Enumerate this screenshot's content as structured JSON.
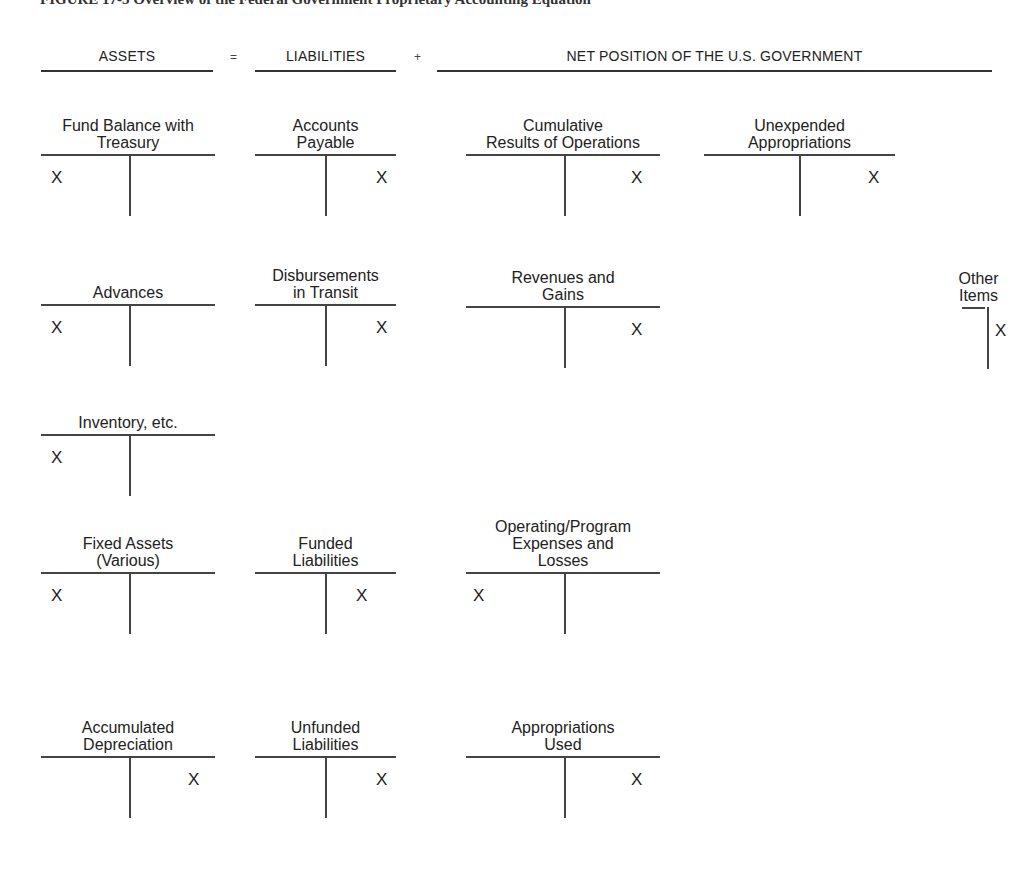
{
  "figure": {
    "title": "FIGURE 17-3  Overview of the Federal Government Proprietary Accounting Equation"
  },
  "equation": {
    "assets": "ASSETS",
    "equals": "=",
    "liabilities": "LIABILITIES",
    "plus": "+",
    "net_position": "NET POSITION OF THE U.S. GOVERNMENT"
  },
  "accounts": {
    "fund_balance": {
      "name": "Fund Balance with Treasury",
      "side": "debit",
      "mark": "X"
    },
    "advances": {
      "name": "Advances",
      "side": "debit",
      "mark": "X"
    },
    "inventory": {
      "name": "Inventory, etc.",
      "side": "debit",
      "mark": "X"
    },
    "fixed_assets": {
      "name": "Fixed Assets (Various)",
      "side": "debit",
      "mark": "X"
    },
    "accumulated_depreciation": {
      "name": "Accumulated Depreciation",
      "side": "credit",
      "mark": "X"
    },
    "accounts_payable": {
      "name": "Accounts Payable",
      "side": "credit",
      "mark": "X"
    },
    "disbursements_in_transit": {
      "name": "Disbursements in Transit",
      "side": "credit",
      "mark": "X"
    },
    "funded_liabilities": {
      "name": "Funded Liabilities",
      "side": "credit",
      "mark": "X"
    },
    "unfunded_liabilities": {
      "name": "Unfunded Liabilities",
      "side": "credit",
      "mark": "X"
    },
    "cumulative_results": {
      "name": "Cumulative Results of Operations",
      "side": "credit",
      "mark": "X"
    },
    "unexpended_appropriations": {
      "name": "Unexpended Appropriations",
      "side": "credit",
      "mark": "X"
    },
    "revenues_gains": {
      "name": "Revenues and Gains",
      "side": "credit",
      "mark": "X"
    },
    "other_items": {
      "name": "Other Items",
      "side": "credit",
      "mark": "X"
    },
    "operating_expenses": {
      "name": "Operating/Program Expenses and Losses",
      "side": "debit",
      "mark": "X"
    },
    "appropriations_used": {
      "name": "Appropriations Used",
      "side": "credit",
      "mark": "X"
    }
  },
  "labels_multiline": {
    "fund_balance": [
      "Fund Balance with",
      "Treasury"
    ],
    "accounts_payable": [
      "Accounts",
      "Payable"
    ],
    "cumulative_results": [
      "Cumulative",
      "Results of Operations"
    ],
    "unexpended_appropriations": [
      "Unexpended",
      "Appropriations"
    ],
    "advances": [
      "Advances"
    ],
    "disbursements_in_transit": [
      "Disbursements",
      "in Transit"
    ],
    "revenues_gains": [
      "Revenues and",
      "Gains"
    ],
    "other_items": [
      "Other",
      "Items"
    ],
    "inventory": [
      "Inventory, etc."
    ],
    "fixed_assets": [
      "Fixed Assets",
      "(Various)"
    ],
    "funded_liabilities": [
      "Funded",
      "Liabilities"
    ],
    "operating_expenses": [
      "Operating/Program",
      "Expenses and",
      "Losses"
    ],
    "accumulated_depreciation": [
      "Accumulated",
      "Depreciation"
    ],
    "unfunded_liabilities": [
      "Unfunded",
      "Liabilities"
    ],
    "appropriations_used": [
      "Appropriations",
      "Used"
    ]
  }
}
